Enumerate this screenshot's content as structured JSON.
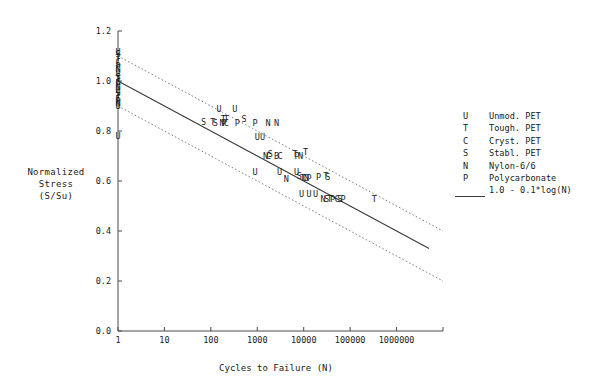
{
  "chart_data": {
    "type": "scatter",
    "title": "",
    "xlabel": "Cycles to Failure (N)",
    "ylabel": "Normalized Stress (S/Su)",
    "ylabel_lines": [
      "Normalized",
      "Stress",
      "(S/Su)"
    ],
    "xscale": "log",
    "xlim": [
      1,
      10000000
    ],
    "ylim": [
      0.0,
      1.2
    ],
    "grid": false,
    "legend_position": "right",
    "xticks": [
      1,
      10,
      100,
      1000,
      10000,
      100000,
      1000000
    ],
    "xticklabels": [
      "1",
      "10",
      "100",
      "1000",
      "10000",
      "100000",
      "1000000"
    ],
    "yticks": [
      0.0,
      0.2,
      0.4,
      0.6,
      0.8,
      1.0,
      1.2
    ],
    "yticklabels": [
      "0.0",
      "0.2",
      "0.4",
      "0.6",
      "0.8",
      "1.0",
      "1.2"
    ],
    "fit": {
      "label": "1.0 - 0.1*log(N)",
      "intercept": 1.0,
      "slope": -0.1,
      "style": "solid"
    },
    "bands": {
      "label": "confidence bounds",
      "style": "dotted",
      "upper_offset": 0.1,
      "lower_offset": -0.1
    },
    "series": [
      {
        "name": "Unmod. PET",
        "code": "U",
        "marker_letter": "U"
      },
      {
        "name": "Tough. PET",
        "code": "T",
        "marker_letter": "T"
      },
      {
        "name": "Cryst. PET",
        "code": "C",
        "marker_letter": "C"
      },
      {
        "name": "Stabl. PET",
        "code": "S",
        "marker_letter": "S"
      },
      {
        "name": "Nylon-6/6",
        "code": "N",
        "marker_letter": "N"
      },
      {
        "name": "Polycarbonate",
        "code": "P",
        "marker_letter": "P"
      }
    ],
    "points": [
      {
        "c": "U",
        "x": 1,
        "y": 1.115
      },
      {
        "c": "S",
        "x": 1,
        "y": 1.105
      },
      {
        "c": "T",
        "x": 1,
        "y": 1.09
      },
      {
        "c": "C",
        "x": 1,
        "y": 1.075
      },
      {
        "c": "P",
        "x": 1,
        "y": 1.06
      },
      {
        "c": "N",
        "x": 1,
        "y": 1.045
      },
      {
        "c": "U",
        "x": 1,
        "y": 1.03
      },
      {
        "c": "S",
        "x": 1,
        "y": 1.015
      },
      {
        "c": "T",
        "x": 1,
        "y": 1.005
      },
      {
        "c": "C",
        "x": 1,
        "y": 0.995
      },
      {
        "c": "P",
        "x": 1,
        "y": 0.985
      },
      {
        "c": "N",
        "x": 1,
        "y": 0.975
      },
      {
        "c": "U",
        "x": 1,
        "y": 0.962
      },
      {
        "c": "S",
        "x": 1,
        "y": 0.95
      },
      {
        "c": "T",
        "x": 1,
        "y": 0.94
      },
      {
        "c": "C",
        "x": 1,
        "y": 0.93
      },
      {
        "c": "P",
        "x": 1,
        "y": 0.92
      },
      {
        "c": "N",
        "x": 1,
        "y": 0.91
      },
      {
        "c": "U",
        "x": 1,
        "y": 0.9
      },
      {
        "c": "U",
        "x": 1,
        "y": 0.78
      },
      {
        "c": "U",
        "x": 150,
        "y": 0.885
      },
      {
        "c": "U",
        "x": 330,
        "y": 0.885
      },
      {
        "c": "S",
        "x": 70,
        "y": 0.835
      },
      {
        "c": "T",
        "x": 110,
        "y": 0.835
      },
      {
        "c": "S",
        "x": 125,
        "y": 0.83
      },
      {
        "c": "T",
        "x": 185,
        "y": 0.845
      },
      {
        "c": "T",
        "x": 215,
        "y": 0.845
      },
      {
        "c": "N",
        "x": 175,
        "y": 0.832
      },
      {
        "c": "P",
        "x": 190,
        "y": 0.83
      },
      {
        "c": "C",
        "x": 215,
        "y": 0.83
      },
      {
        "c": "P",
        "x": 370,
        "y": 0.832
      },
      {
        "c": "S",
        "x": 520,
        "y": 0.845
      },
      {
        "c": "P",
        "x": 900,
        "y": 0.832
      },
      {
        "c": "N",
        "x": 1700,
        "y": 0.832
      },
      {
        "c": "N",
        "x": 2600,
        "y": 0.832
      },
      {
        "c": "U",
        "x": 1000,
        "y": 0.775
      },
      {
        "c": "U",
        "x": 1300,
        "y": 0.775
      },
      {
        "c": "N",
        "x": 1500,
        "y": 0.7
      },
      {
        "c": "C",
        "x": 1750,
        "y": 0.7
      },
      {
        "c": "S",
        "x": 1900,
        "y": 0.705
      },
      {
        "c": "B",
        "x": 2600,
        "y": 0.7
      },
      {
        "c": "C",
        "x": 3100,
        "y": 0.7
      },
      {
        "c": "T",
        "x": 6500,
        "y": 0.705
      },
      {
        "c": "P",
        "x": 7200,
        "y": 0.7
      },
      {
        "c": "N",
        "x": 8500,
        "y": 0.697
      },
      {
        "c": "T",
        "x": 11000,
        "y": 0.715
      },
      {
        "c": "U",
        "x": 900,
        "y": 0.635
      },
      {
        "c": "U",
        "x": 3000,
        "y": 0.635
      },
      {
        "c": "U",
        "x": 7000,
        "y": 0.635
      },
      {
        "c": "N",
        "x": 4200,
        "y": 0.608
      },
      {
        "c": "S",
        "x": 8000,
        "y": 0.618
      },
      {
        "c": "T",
        "x": 9500,
        "y": 0.612
      },
      {
        "c": "C",
        "x": 10500,
        "y": 0.612
      },
      {
        "c": "N",
        "x": 11500,
        "y": 0.612
      },
      {
        "c": "P",
        "x": 13000,
        "y": 0.612
      },
      {
        "c": "P",
        "x": 21000,
        "y": 0.615
      },
      {
        "c": "T",
        "x": 30000,
        "y": 0.618
      },
      {
        "c": "S",
        "x": 33000,
        "y": 0.615
      },
      {
        "c": "U",
        "x": 9000,
        "y": 0.545
      },
      {
        "c": "U",
        "x": 13000,
        "y": 0.545
      },
      {
        "c": "U",
        "x": 18000,
        "y": 0.545
      },
      {
        "c": "N",
        "x": 26000,
        "y": 0.525
      },
      {
        "c": "S",
        "x": 31000,
        "y": 0.528
      },
      {
        "c": "T",
        "x": 36000,
        "y": 0.528
      },
      {
        "c": "P",
        "x": 42000,
        "y": 0.525
      },
      {
        "c": "C",
        "x": 52000,
        "y": 0.528
      },
      {
        "c": "S",
        "x": 60000,
        "y": 0.528
      },
      {
        "c": "P",
        "x": 70000,
        "y": 0.525
      },
      {
        "c": "T",
        "x": 330000,
        "y": 0.528
      }
    ]
  },
  "legend": {
    "entries": [
      {
        "symbol": "U",
        "label": "Unmod. PET"
      },
      {
        "symbol": "T",
        "label": "Tough. PET"
      },
      {
        "symbol": "C",
        "label": "Cryst. PET"
      },
      {
        "symbol": "S",
        "label": "Stabl. PET"
      },
      {
        "symbol": "N",
        "label": "Nylon-6/6"
      },
      {
        "symbol": "P",
        "label": "Polycarbonate"
      }
    ],
    "fit_label": "1.0 - 0.1*log(N)"
  },
  "colors": {
    "axis": "#4a4a4a",
    "fit_line": "#3a3a3a",
    "band_line": "#6f6f6f",
    "marker": "#1d1d1d",
    "background": "#ffffff"
  }
}
